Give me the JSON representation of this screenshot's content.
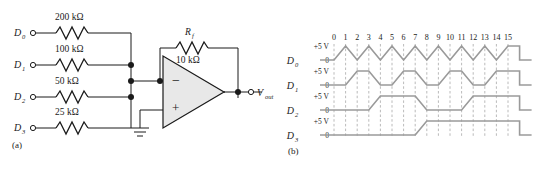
{
  "figure": {
    "panel_a": {
      "caption": "(a)",
      "title": "4-bit binary-weighted resistor DAC (summing inverting op-amp)",
      "inputs": [
        {
          "label": "D",
          "sub": "0",
          "resistor": "200 kΩ"
        },
        {
          "label": "D",
          "sub": "1",
          "resistor": "100 kΩ"
        },
        {
          "label": "D",
          "sub": "2",
          "resistor": "50 kΩ"
        },
        {
          "label": "D",
          "sub": "3",
          "resistor": "25 kΩ"
        }
      ],
      "feedback": {
        "symbol": "R",
        "symbol_sub": "f",
        "value": "10 kΩ"
      },
      "opamp": {
        "inverting_sign": "−",
        "noninverting_sign": "+"
      },
      "output": {
        "label": "V",
        "sub": "out"
      }
    },
    "panel_b": {
      "caption": "(b)",
      "ticks": [
        "0",
        "1",
        "2",
        "3",
        "4",
        "5",
        "6",
        "7",
        "8",
        "9",
        "10",
        "11",
        "12",
        "13",
        "14",
        "15"
      ],
      "high_label": "+5 V",
      "low_label": "0",
      "rows": [
        {
          "label": "D",
          "sub": "0",
          "period": 2,
          "values": [
            0,
            1,
            0,
            1,
            0,
            1,
            0,
            1,
            0,
            1,
            0,
            1,
            0,
            1,
            0,
            1
          ]
        },
        {
          "label": "D",
          "sub": "1",
          "period": 4,
          "values": [
            0,
            0,
            1,
            1,
            0,
            0,
            1,
            1,
            0,
            0,
            1,
            1,
            0,
            0,
            1,
            1
          ]
        },
        {
          "label": "D",
          "sub": "2",
          "period": 8,
          "values": [
            0,
            0,
            0,
            0,
            1,
            1,
            1,
            1,
            0,
            0,
            0,
            0,
            1,
            1,
            1,
            1
          ]
        },
        {
          "label": "D",
          "sub": "3",
          "period": 16,
          "values": [
            0,
            0,
            0,
            0,
            0,
            0,
            0,
            0,
            1,
            1,
            1,
            1,
            1,
            1,
            1,
            1
          ]
        }
      ]
    }
  },
  "colors": {
    "ink": "#1a1a1a",
    "waveform": "#9a9a9a",
    "dashed_guide": "#a8a8a8",
    "opamp_fill": "#e8e8e8",
    "background": "#ffffff"
  }
}
